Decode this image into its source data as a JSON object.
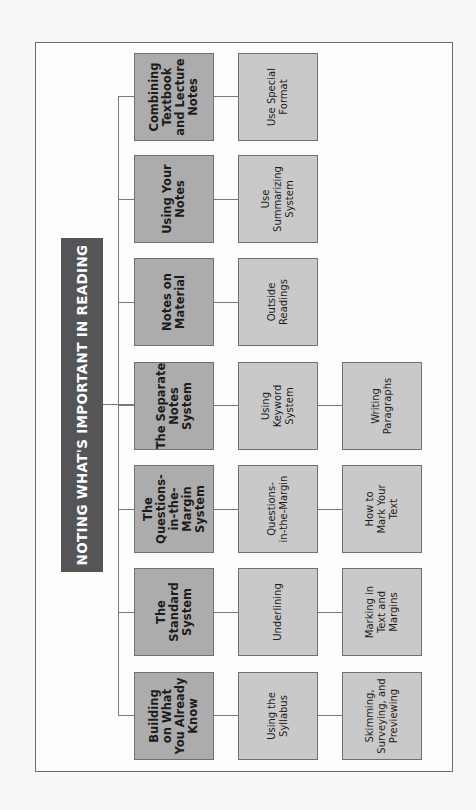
{
  "diagram": {
    "title": "NOTING WHAT'S IMPORTANT IN READING",
    "colors": {
      "title_bg": "#555558",
      "main_box": "#acacac",
      "sub_box": "#c9c9c9",
      "connector": "#7a7a7a"
    },
    "branches": [
      {
        "label": "Combining\nTextbook\nand Lecture\nNotes",
        "children": [
          "Use Special\nFormat"
        ]
      },
      {
        "label": "Using Your\nNotes",
        "children": [
          "Use\nSummarizing\nSystem"
        ]
      },
      {
        "label": "Notes on\nMaterial",
        "children": [
          "Outside\nReadings"
        ]
      },
      {
        "label": "The Separate\nNotes\nSystem",
        "children": [
          "Using\nKeyword\nSystem",
          "Writing\nParagraphs"
        ]
      },
      {
        "label": "The\nQuestions-\nin-the-Margin\nSystem",
        "children": [
          "Questions-\nin-the-Margin",
          "How to\nMark Your\nText"
        ]
      },
      {
        "label": "The\nStandard\nSystem",
        "children": [
          "Underlining",
          "Marking in\nText and\nMargins"
        ]
      },
      {
        "label": "Building\non What\nYou Already\nKnow",
        "children": [
          "Using the\nSyllabus",
          "Skimming,\nSurveying, and\nPreviewing"
        ]
      }
    ]
  }
}
